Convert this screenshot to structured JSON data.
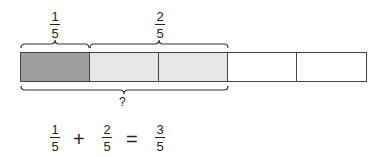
{
  "diagram": {
    "total_parts": 5,
    "segments": [
      {
        "fill": "#9e9e9e",
        "label": "1/5 part"
      },
      {
        "fill": "#e6e6e6",
        "label": "2/5 part"
      },
      {
        "fill": "#e6e6e6",
        "label": "2/5 part"
      },
      {
        "fill": "#ffffff",
        "label": "empty"
      },
      {
        "fill": "#ffffff",
        "label": "empty"
      }
    ],
    "top_labels": [
      {
        "num": "1",
        "den": "5"
      },
      {
        "num": "2",
        "den": "5"
      }
    ],
    "bottom_label": "?"
  },
  "equation": {
    "a": {
      "num": "1",
      "den": "5"
    },
    "plus": "+",
    "b": {
      "num": "2",
      "den": "5"
    },
    "equals": "=",
    "result": {
      "num": "3",
      "den": "5"
    }
  }
}
